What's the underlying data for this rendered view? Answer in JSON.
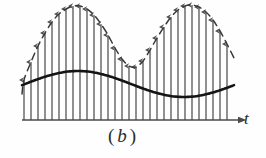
{
  "figure": {
    "caption_open_paren": "(",
    "caption_letter": "b",
    "caption_close_paren": ")",
    "axis_label_t": "t",
    "colors": {
      "axis": "#4a4a4a",
      "impulse": "#555555",
      "envelope_dashed": "#3a3a3a",
      "modulating_solid": "#1a1a1a",
      "background": "#fefefe"
    }
  },
  "chart_data": {
    "type": "line",
    "title": "",
    "subtitle": "",
    "xlabel": "t",
    "ylabel": "",
    "grid": false,
    "legend": null,
    "axis": {
      "baseline_y_px": 120,
      "x_start_px": 22,
      "x_end_px": 232,
      "arrow_tip_px": 238
    },
    "annotations": [
      {
        "text": "(b)",
        "x_px": 108,
        "y_px": 126,
        "role": "subfigure-caption"
      },
      {
        "text": "t",
        "x_px": 244,
        "y_px": 110,
        "role": "axis-label"
      }
    ],
    "series": [
      {
        "name": "impulse-train",
        "type": "impulse",
        "description": "Sampled impulses whose peak heights trace the dashed envelope",
        "count": 30,
        "x_first_px": 24,
        "x_step_px": 7.0,
        "baseline_y_px": 120,
        "peaks_y_px": [
          80,
          62,
          46,
          33,
          22,
          14,
          9,
          6,
          6,
          9,
          15,
          24,
          35,
          48,
          59,
          66,
          67,
          61,
          50,
          38,
          27,
          17,
          10,
          6,
          5,
          7,
          12,
          20,
          31,
          44
        ]
      },
      {
        "name": "envelope-upper-dashed",
        "type": "dashed-curve",
        "description": "Two-lobe dashed envelope tracing the impulse peak amplitudes",
        "x_range_px": [
          22,
          234
        ],
        "peak1_x_px": 75,
        "peak1_y_px": 6,
        "trough_x_px": 130,
        "trough_y_px": 67,
        "peak2_x_px": 182,
        "peak2_y_px": 5,
        "end_y_px": 58
      },
      {
        "name": "modulating-signal-solid",
        "type": "solid-curve",
        "description": "Bold solid sinusoidal modulating signal drawn across the impulse train",
        "x_range_px": [
          22,
          234
        ],
        "mean_y_px": 84,
        "amplitude_px": 13,
        "crest1_x_px": 78,
        "crest1_y_px": 71,
        "valley_x_px": 131,
        "valley_y_px": 95,
        "crest2_x_px": 184,
        "crest2_y_px": 70
      }
    ]
  }
}
